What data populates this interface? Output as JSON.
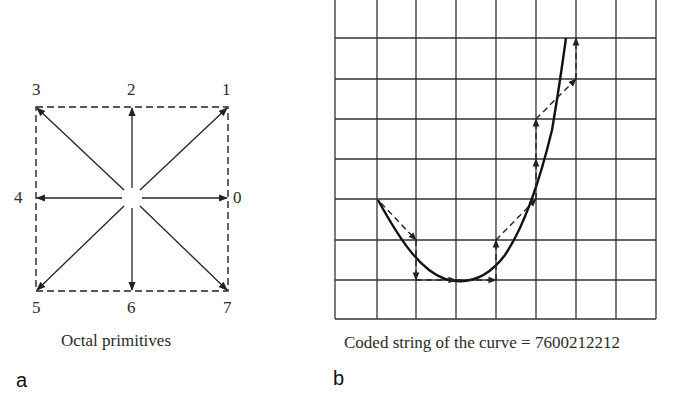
{
  "panel_a": {
    "label": "a",
    "caption": "Octal primitives",
    "direction_labels": {
      "d0": "0",
      "d1": "1",
      "d2": "2",
      "d3": "3",
      "d4": "4",
      "d5": "5",
      "d6": "6",
      "d7": "7"
    }
  },
  "panel_b": {
    "label": "b",
    "caption": "Coded string of the curve = 7600212212",
    "grid": {
      "columns": 8,
      "rows": 8
    },
    "chain_code": "7600212212"
  },
  "colors": {
    "ink": "#222222",
    "background": "#ffffff"
  }
}
